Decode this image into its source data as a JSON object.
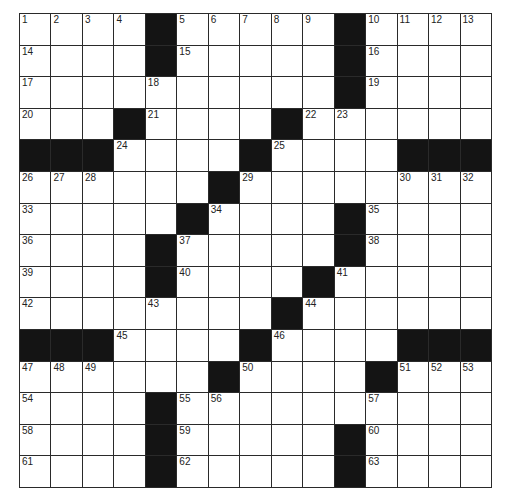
{
  "puzzle": {
    "rows": 15,
    "cols": 15,
    "colors": {
      "black": "#141414",
      "white": "#ffffff",
      "line": "#2a2a2a"
    },
    "grid": [
      "....#.....#....",
      "....#.....#....",
      "..........#....",
      "...#....#......",
      "###....#....###",
      "......#........",
      ".....#....#....",
      "....#.....#....",
      "....#....#.....",
      "........#......",
      "###....#....###",
      "......#....#...",
      "....#..........",
      "....#.....#....",
      "....#.....#...."
    ],
    "numbers": [
      {
        "r": 0,
        "c": 0,
        "n": "1"
      },
      {
        "r": 0,
        "c": 1,
        "n": "2"
      },
      {
        "r": 0,
        "c": 2,
        "n": "3"
      },
      {
        "r": 0,
        "c": 3,
        "n": "4"
      },
      {
        "r": 0,
        "c": 5,
        "n": "5"
      },
      {
        "r": 0,
        "c": 6,
        "n": "6"
      },
      {
        "r": 0,
        "c": 7,
        "n": "7"
      },
      {
        "r": 0,
        "c": 8,
        "n": "8"
      },
      {
        "r": 0,
        "c": 9,
        "n": "9"
      },
      {
        "r": 0,
        "c": 11,
        "n": "10"
      },
      {
        "r": 0,
        "c": 12,
        "n": "11"
      },
      {
        "r": 0,
        "c": 13,
        "n": "12"
      },
      {
        "r": 0,
        "c": 14,
        "n": "13"
      },
      {
        "r": 1,
        "c": 0,
        "n": "14"
      },
      {
        "r": 1,
        "c": 5,
        "n": "15"
      },
      {
        "r": 1,
        "c": 11,
        "n": "16"
      },
      {
        "r": 2,
        "c": 0,
        "n": "17"
      },
      {
        "r": 2,
        "c": 4,
        "n": "18"
      },
      {
        "r": 2,
        "c": 11,
        "n": "19"
      },
      {
        "r": 3,
        "c": 0,
        "n": "20"
      },
      {
        "r": 3,
        "c": 4,
        "n": "21"
      },
      {
        "r": 3,
        "c": 9,
        "n": "22"
      },
      {
        "r": 3,
        "c": 10,
        "n": "23"
      },
      {
        "r": 4,
        "c": 3,
        "n": "24"
      },
      {
        "r": 4,
        "c": 8,
        "n": "25"
      },
      {
        "r": 5,
        "c": 0,
        "n": "26"
      },
      {
        "r": 5,
        "c": 1,
        "n": "27"
      },
      {
        "r": 5,
        "c": 2,
        "n": "28"
      },
      {
        "r": 5,
        "c": 7,
        "n": "29"
      },
      {
        "r": 5,
        "c": 12,
        "n": "30"
      },
      {
        "r": 5,
        "c": 13,
        "n": "31"
      },
      {
        "r": 5,
        "c": 14,
        "n": "32"
      },
      {
        "r": 6,
        "c": 0,
        "n": "33"
      },
      {
        "r": 6,
        "c": 6,
        "n": "34"
      },
      {
        "r": 6,
        "c": 11,
        "n": "35"
      },
      {
        "r": 7,
        "c": 0,
        "n": "36"
      },
      {
        "r": 7,
        "c": 5,
        "n": "37"
      },
      {
        "r": 7,
        "c": 11,
        "n": "38"
      },
      {
        "r": 8,
        "c": 0,
        "n": "39"
      },
      {
        "r": 8,
        "c": 5,
        "n": "40"
      },
      {
        "r": 8,
        "c": 10,
        "n": "41"
      },
      {
        "r": 9,
        "c": 0,
        "n": "42"
      },
      {
        "r": 9,
        "c": 4,
        "n": "43"
      },
      {
        "r": 9,
        "c": 9,
        "n": "44"
      },
      {
        "r": 10,
        "c": 3,
        "n": "45"
      },
      {
        "r": 10,
        "c": 8,
        "n": "46"
      },
      {
        "r": 11,
        "c": 0,
        "n": "47"
      },
      {
        "r": 11,
        "c": 1,
        "n": "48"
      },
      {
        "r": 11,
        "c": 2,
        "n": "49"
      },
      {
        "r": 11,
        "c": 7,
        "n": "50"
      },
      {
        "r": 11,
        "c": 12,
        "n": "51"
      },
      {
        "r": 11,
        "c": 13,
        "n": "52"
      },
      {
        "r": 11,
        "c": 14,
        "n": "53"
      },
      {
        "r": 12,
        "c": 0,
        "n": "54"
      },
      {
        "r": 12,
        "c": 5,
        "n": "55"
      },
      {
        "r": 12,
        "c": 6,
        "n": "56"
      },
      {
        "r": 12,
        "c": 11,
        "n": "57"
      },
      {
        "r": 13,
        "c": 0,
        "n": "58"
      },
      {
        "r": 13,
        "c": 5,
        "n": "59"
      },
      {
        "r": 13,
        "c": 11,
        "n": "60"
      },
      {
        "r": 14,
        "c": 0,
        "n": "61"
      },
      {
        "r": 14,
        "c": 5,
        "n": "62"
      },
      {
        "r": 14,
        "c": 11,
        "n": "63"
      }
    ]
  }
}
